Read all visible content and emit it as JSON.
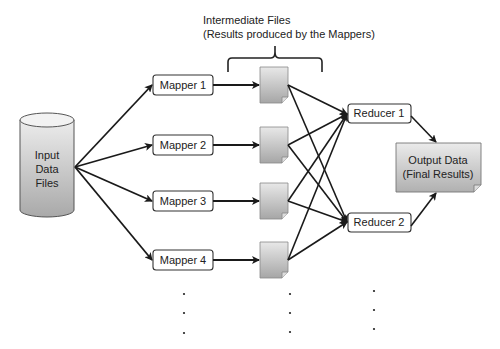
{
  "title": {
    "line1": "Intermediate  Files",
    "line2": "(Results produced by the Mappers)"
  },
  "input": {
    "line1": "Input",
    "line2": "Data",
    "line3": "Files"
  },
  "mappers": [
    {
      "label": "Mapper 1"
    },
    {
      "label": "Mapper 2"
    },
    {
      "label": "Mapper 3"
    },
    {
      "label": "Mapper 4"
    }
  ],
  "reducers": [
    {
      "label": "Reducer 1"
    },
    {
      "label": "Reducer 2"
    }
  ],
  "output": {
    "line1": "Output Data",
    "line2": "(Final Results)"
  },
  "colors": {
    "box_border": "#333333",
    "doc_fill_top": "#e6e6e6",
    "doc_fill_bottom": "#a8a8a8",
    "arrow": "#1a1a1a"
  }
}
